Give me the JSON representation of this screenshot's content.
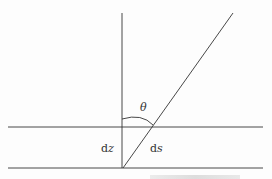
{
  "diagram": {
    "type": "geometry",
    "labels": {
      "angle": "θ",
      "vertical_segment": "dz",
      "slant_segment": "ds"
    },
    "elements": [
      {
        "name": "vertical-line",
        "from": [
          122,
          13
        ],
        "to": [
          122,
          168
        ]
      },
      {
        "name": "slant-line",
        "from": [
          123,
          168
        ],
        "to": [
          233,
          13
        ]
      },
      {
        "name": "upper-boundary",
        "from": [
          8,
          127
        ],
        "to": [
          263,
          127
        ]
      },
      {
        "name": "lower-boundary",
        "from": [
          8,
          168
        ],
        "to": [
          263,
          168
        ]
      },
      {
        "name": "angle-arc",
        "center": [
          122,
          127
        ],
        "radius": 32
      }
    ],
    "colors": {
      "line": "#333333",
      "background": "#fdfdfd"
    }
  },
  "caption": {
    "text": ""
  }
}
